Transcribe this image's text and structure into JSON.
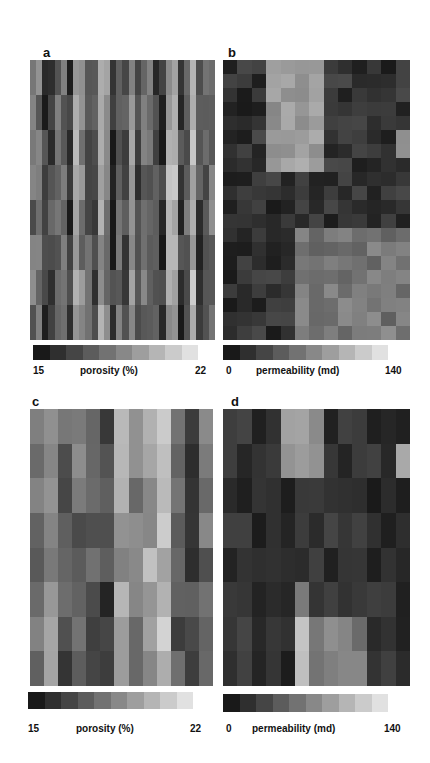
{
  "figure": {
    "panels": [
      {
        "letter": "a",
        "variable": "porosity",
        "colorbar": {
          "min": "15",
          "label": "porosity (%)",
          "max": "22"
        }
      },
      {
        "letter": "b",
        "variable": "permeability",
        "colorbar": {
          "min": "0",
          "label": "permeability (md)",
          "max": "140"
        }
      },
      {
        "letter": "c",
        "variable": "porosity",
        "colorbar": {
          "min": "15",
          "label": "porosity (%)",
          "max": "22"
        }
      },
      {
        "letter": "d",
        "variable": "permeability",
        "colorbar": {
          "min": "0",
          "label": "permeability (md)",
          "max": "140"
        }
      }
    ],
    "colormap": "grayscale, dark = low, light = high"
  },
  "chart_data": [
    {
      "type": "heatmap",
      "title": "a",
      "colorbar_label": "porosity (%)",
      "range": [
        15,
        22
      ],
      "rows": 8,
      "cols": 30,
      "description": "Fine-scale porosity field with strongly vertically elongated (column-like) cells; high-frequency lateral variation"
    },
    {
      "type": "heatmap",
      "title": "b",
      "colorbar_label": "permeability (md)",
      "range": [
        0,
        140
      ],
      "rows": 20,
      "cols": 13,
      "description": "Permeability field; mostly low values with a bright high-permeability zone in the upper-center columns and a bright region in the lower-right"
    },
    {
      "type": "heatmap",
      "title": "c",
      "colorbar_label": "porosity (%)",
      "range": [
        15,
        22
      ],
      "rows": 8,
      "cols": 13,
      "description": "Coarsened porosity field, blocky vertical columns"
    },
    {
      "type": "heatmap",
      "title": "d",
      "colorbar_label": "permeability (md)",
      "range": [
        0,
        140
      ],
      "rows": 8,
      "cols": 13,
      "description": "Coarsened permeability field; mostly dark with bright upper-center columns and a bright patch in the lower-center"
    }
  ]
}
